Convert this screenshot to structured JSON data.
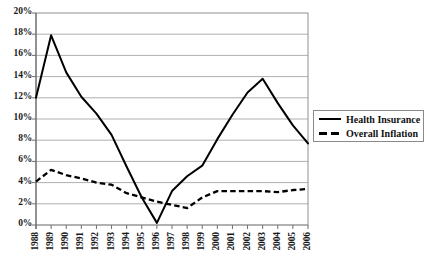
{
  "chart_data": {
    "type": "line",
    "title": "",
    "xlabel": "",
    "ylabel": "",
    "grid": true,
    "legend_position": "right",
    "ylim": [
      0,
      20
    ],
    "ytick_labels": [
      "0%",
      "2%",
      "4%",
      "6%",
      "8%",
      "10%",
      "12%",
      "14%",
      "16%",
      "18%",
      "20%"
    ],
    "ytick_values": [
      0,
      2,
      4,
      6,
      8,
      10,
      12,
      14,
      16,
      18,
      20
    ],
    "categories": [
      "1988",
      "1989",
      "1990",
      "1991",
      "1992",
      "1993",
      "1994",
      "1995",
      "1996",
      "1997",
      "1998",
      "1999",
      "2000",
      "2001",
      "2002",
      "2003",
      "2004",
      "2005",
      "2006"
    ],
    "series": [
      {
        "name": "Health Insurance",
        "style": "solid",
        "color": "#000000",
        "values": [
          12.0,
          17.9,
          14.4,
          12.1,
          10.5,
          8.5,
          5.5,
          2.6,
          0.2,
          3.2,
          4.6,
          5.6,
          8.1,
          10.4,
          12.5,
          13.8,
          11.5,
          9.4,
          7.7
        ]
      },
      {
        "name": "Overall Inflation",
        "style": "dashed",
        "color": "#000000",
        "values": [
          4.1,
          5.2,
          4.7,
          4.4,
          4.0,
          3.8,
          3.0,
          2.6,
          2.2,
          1.9,
          1.6,
          2.6,
          3.2,
          3.2,
          3.2,
          3.2,
          3.1,
          3.3,
          3.4
        ]
      }
    ]
  },
  "legend": {
    "items": [
      {
        "label": "Health Insurance",
        "style": "solid"
      },
      {
        "label": "Overall Inflation",
        "style": "dashed"
      }
    ]
  },
  "axes": {
    "plot_left": 36,
    "plot_right": 308,
    "plot_top": 13,
    "plot_bottom": 225
  }
}
